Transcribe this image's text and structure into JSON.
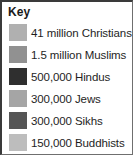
{
  "legend": {
    "title": "Key",
    "entries": [
      {
        "label": "41 million Christians",
        "count_text": "41 million",
        "group": "Christians",
        "value": 41000000,
        "color": "#b0b0b0"
      },
      {
        "label": "1.5 million Muslims",
        "count_text": "1.5 million",
        "group": "Muslims",
        "value": 1500000,
        "color": "#919191"
      },
      {
        "label": "500,000 Hindus",
        "count_text": "500,000",
        "group": "Hindus",
        "value": 500000,
        "color": "#2f2f2f"
      },
      {
        "label": "300,000 Jews",
        "count_text": "300,000",
        "group": "Jews",
        "value": 300000,
        "color": "#a5a5a5"
      },
      {
        "label": "300,000 Sikhs",
        "count_text": "300,000",
        "group": "Sikhs",
        "value": 300000,
        "color": "#555555"
      },
      {
        "label": "150,000 Buddhists",
        "count_text": "150,000",
        "group": "Buddhists",
        "value": 150000,
        "color": "#bdbdbd"
      }
    ]
  },
  "chart_data": {
    "type": "table",
    "title": "Key",
    "categories": [
      "Christians",
      "Muslims",
      "Hindus",
      "Jews",
      "Sikhs",
      "Buddhists"
    ],
    "values": [
      41000000,
      1500000,
      500000,
      300000,
      300000,
      150000
    ],
    "value_labels": [
      "41 million",
      "1.5 million",
      "500,000",
      "300,000",
      "300,000",
      "150,000"
    ],
    "swatch_colors": [
      "#b0b0b0",
      "#919191",
      "#2f2f2f",
      "#a5a5a5",
      "#555555",
      "#bdbdbd"
    ],
    "xlabel": "",
    "ylabel": "",
    "legend_position": "panel"
  }
}
